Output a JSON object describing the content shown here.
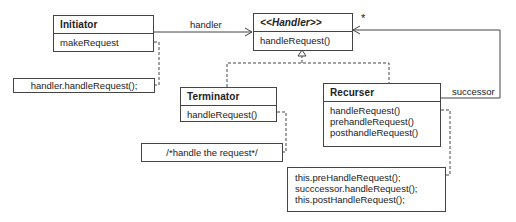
{
  "diagram": {
    "type": "UML class diagram (Chain of Responsibility)",
    "classes": [
      {
        "name": "Initiator",
        "methods": [
          "makeRequest"
        ]
      },
      {
        "name": "<<Handler>>",
        "methods": [
          "handleRequest()"
        ]
      },
      {
        "name": "Terminator",
        "methods": [
          "handleRequest()"
        ]
      },
      {
        "name": "Recurser",
        "methods": [
          "handleRequest()",
          "prehandleRequest()",
          "posthandleRequest()"
        ]
      }
    ],
    "notes": {
      "initiator": "handler.handleRequest();",
      "terminator": "/*handle the request*/",
      "recurser": [
        "this.preHandleRequest();",
        "succcessor.handleRequest();",
        "this.postHandleRequest();"
      ]
    },
    "associations": {
      "handler_label": "handler",
      "successor_label": "successor",
      "multiplicity": "*"
    }
  }
}
